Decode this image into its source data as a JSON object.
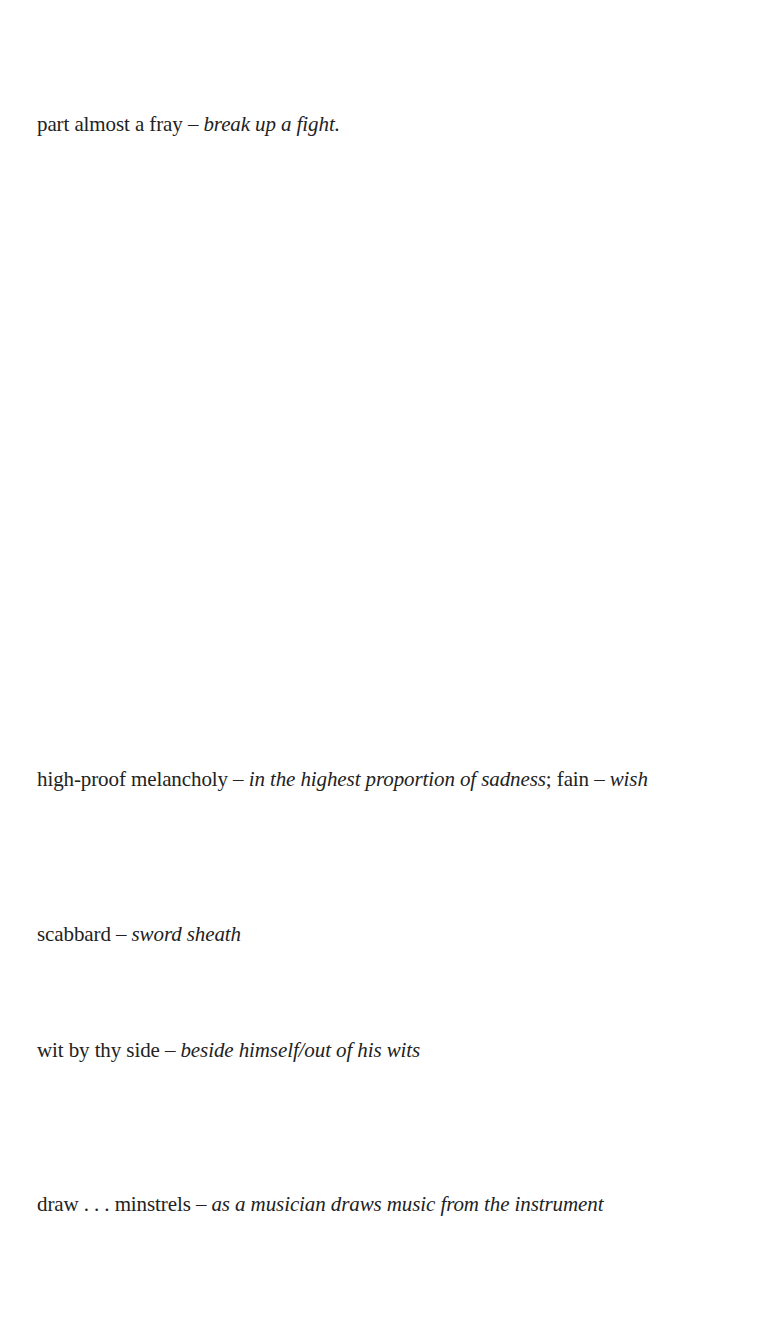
{
  "glosses": [
    {
      "parts": [
        {
          "type": "term",
          "text": "part almost a fray"
        },
        {
          "type": "dash",
          "text": " – "
        },
        {
          "type": "def",
          "text": "break up a fight."
        }
      ]
    },
    {
      "parts": [
        {
          "type": "term",
          "text": "high-proof melancholy"
        },
        {
          "type": "dash",
          "text": " – "
        },
        {
          "type": "def",
          "text": "in the highest proportion of sadness"
        },
        {
          "type": "sep",
          "text": "; fain"
        },
        {
          "type": "dash",
          "text": " – "
        },
        {
          "type": "def",
          "text": "wish"
        }
      ]
    },
    {
      "parts": [
        {
          "type": "term",
          "text": "scabbard"
        },
        {
          "type": "dash",
          "text": " – "
        },
        {
          "type": "def",
          "text": "sword sheath"
        }
      ]
    },
    {
      "parts": [
        {
          "type": "term",
          "text": "wit by thy side"
        },
        {
          "type": "dash",
          "text": " – "
        },
        {
          "type": "def",
          "text": "beside himself/out of his wits"
        }
      ]
    },
    {
      "parts": [
        {
          "type": "term",
          "text": "draw . . . minstrels"
        },
        {
          "type": "dash",
          "text": " – "
        },
        {
          "type": "def",
          "text": "as a musician draws music from the instrument"
        }
      ]
    }
  ]
}
